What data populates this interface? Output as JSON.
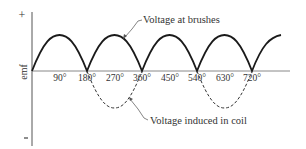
{
  "diagram": {
    "axis": {
      "y_label": "emf",
      "y_plus": "+",
      "y_minus": "−",
      "x_ticks": [
        "90°",
        "180°",
        "270°",
        "360°",
        "450°",
        "540°",
        "630°",
        "720°"
      ]
    },
    "curves": {
      "brushes": {
        "label": "Voltage at brushes",
        "style": "solid"
      },
      "coil": {
        "label": "Voltage induced in coil",
        "style": "dashed"
      }
    },
    "colors": {
      "line": "#1a1a1a",
      "axis": "#555555",
      "text": "#333333"
    }
  }
}
